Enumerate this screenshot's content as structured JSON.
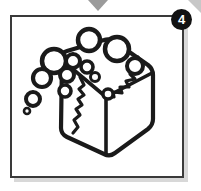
{
  "panel": {
    "badge_number": "4",
    "frame_color": "#3a3a3a",
    "background_color": "#ffffff",
    "ink_color": "#1a1a1a",
    "marker_color": "#9b9b9b",
    "shadow_color": "#d8d8d8"
  },
  "illustration": {
    "title": "ice-cube-with-bubbles",
    "description": "Line drawing of a cube of ice seen in isometric view with cracks across the top and left faces and air bubbles rising from its upper-left corner",
    "subject": "ice cube",
    "style": "black-and-white line art",
    "bubble_count": "11"
  },
  "markers": {
    "top_arrow": "down-triangle",
    "corner_accent": "diagonal-sliver"
  }
}
